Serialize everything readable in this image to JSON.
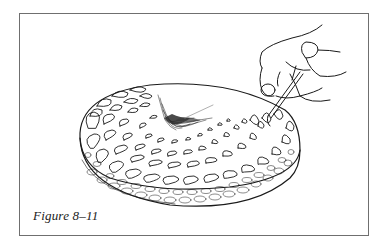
{
  "figure": {
    "caption": "Figure 8–11",
    "colors": {
      "frame": "#6f6f6f",
      "ink": "#1a1a1a",
      "background": "#ffffff"
    }
  }
}
